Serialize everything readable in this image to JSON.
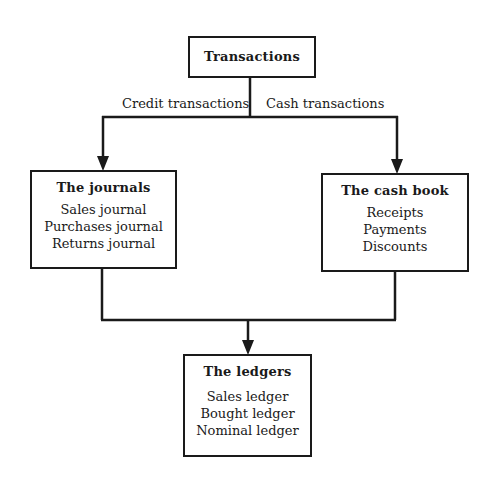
{
  "diagram": {
    "root": {
      "title": "Transactions"
    },
    "branches": {
      "left_label": "Credit transactions",
      "right_label": "Cash transactions"
    },
    "journals": {
      "title": "The journals",
      "items": [
        "Sales journal",
        "Purchases journal",
        "Returns journal"
      ]
    },
    "cash_book": {
      "title": "The cash book",
      "items": [
        "Receipts",
        "Payments",
        "Discounts"
      ]
    },
    "ledgers": {
      "title": "The ledgers",
      "items": [
        "Sales ledger",
        "Bought ledger",
        "Nominal ledger"
      ]
    },
    "colors": {
      "line": "#1a1a1a",
      "background": "#ffffff"
    }
  }
}
